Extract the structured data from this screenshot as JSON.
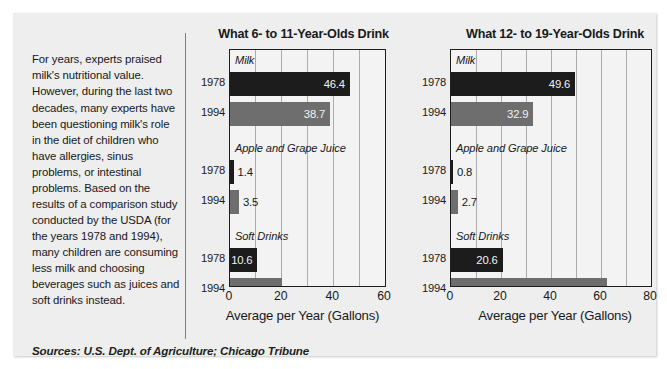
{
  "article": {
    "body": "For years, experts praised milk's nutritional value. However, during the last two decades, many experts have been questioning milk's role in the diet of children who have allergies, sinus problems, or intestinal problems. Based on the results of a comparison study conducted by the USDA (for the years 1978 and 1994), many children are consuming less milk and choosing beverages such as juices and soft drinks instead."
  },
  "sources": {
    "text": "Sources: U.S. Dept. of Agriculture; Chicago Tribune"
  },
  "colors": {
    "bar_1978": "#1c1c1c",
    "bar_1994": "#6e6e6e",
    "panel_background": "#eeeeee",
    "plot_background": "#f3f3f3",
    "frame": "#1b1d1f",
    "gridline": "#a9abad",
    "text": "#17191b"
  },
  "chart_data": [
    {
      "id": "chart-left",
      "type": "bar",
      "orientation": "horizontal",
      "title": "What 6- to 11-Year-Olds Drink",
      "xlabel": "Average per Year (Gallons)",
      "ylabel": "",
      "xlim": [
        0,
        60
      ],
      "xticks": [
        0,
        20,
        40,
        60
      ],
      "xtick_labels": [
        "0",
        "20",
        "40",
        "60"
      ],
      "grid": true,
      "legend": "none",
      "categories": [
        "Milk",
        "Apple and Grape Juice",
        "Soft Drinks"
      ],
      "series": [
        {
          "name": "1978",
          "values": [
            46.4,
            1.4,
            10.6
          ]
        },
        {
          "name": "1994",
          "values": [
            38.7,
            3.5,
            20.0
          ]
        }
      ],
      "bars": [
        {
          "category": "Milk",
          "year": "1978",
          "value": 46.4,
          "label": "46.4",
          "label_position": "inside"
        },
        {
          "category": "Milk",
          "year": "1994",
          "value": 38.7,
          "label": "38.7",
          "label_position": "inside"
        },
        {
          "category": "Apple and Grape Juice",
          "year": "1978",
          "value": 1.4,
          "label": "1.4",
          "label_position": "outside"
        },
        {
          "category": "Apple and Grape Juice",
          "year": "1994",
          "value": 3.5,
          "label": "3.5",
          "label_position": "outside"
        },
        {
          "category": "Soft Drinks",
          "year": "1978",
          "value": 10.6,
          "label": "10.6",
          "label_position": "inside"
        },
        {
          "category": "Soft Drinks",
          "year": "1994",
          "value": 20.0,
          "label": "20.0",
          "label_position": "inside"
        }
      ]
    },
    {
      "id": "chart-right",
      "type": "bar",
      "orientation": "horizontal",
      "title": "What 12- to 19-Year-Olds Drink",
      "xlabel": "Average per Year (Gallons)",
      "ylabel": "",
      "xlim": [
        0,
        80
      ],
      "xticks": [
        0,
        20,
        40,
        60,
        80
      ],
      "xtick_labels": [
        "0",
        "20",
        "40",
        "60",
        "80"
      ],
      "grid": true,
      "legend": "none",
      "categories": [
        "Milk",
        "Apple and Grape Juice",
        "Soft Drinks"
      ],
      "series": [
        {
          "name": "1978",
          "values": [
            49.6,
            0.8,
            20.6
          ]
        },
        {
          "name": "1994",
          "values": [
            32.9,
            2.7,
            62.5
          ]
        }
      ],
      "bars": [
        {
          "category": "Milk",
          "year": "1978",
          "value": 49.6,
          "label": "49.6",
          "label_position": "inside"
        },
        {
          "category": "Milk",
          "year": "1994",
          "value": 32.9,
          "label": "32.9",
          "label_position": "inside"
        },
        {
          "category": "Apple and Grape Juice",
          "year": "1978",
          "value": 0.8,
          "label": "0.8",
          "label_position": "outside"
        },
        {
          "category": "Apple and Grape Juice",
          "year": "1994",
          "value": 2.7,
          "label": "2.7",
          "label_position": "outside"
        },
        {
          "category": "Soft Drinks",
          "year": "1978",
          "value": 20.6,
          "label": "20.6",
          "label_position": "inside"
        },
        {
          "category": "Soft Drinks",
          "year": "1994",
          "value": 62.5,
          "label": "62.5",
          "label_position": "inside"
        }
      ]
    }
  ]
}
